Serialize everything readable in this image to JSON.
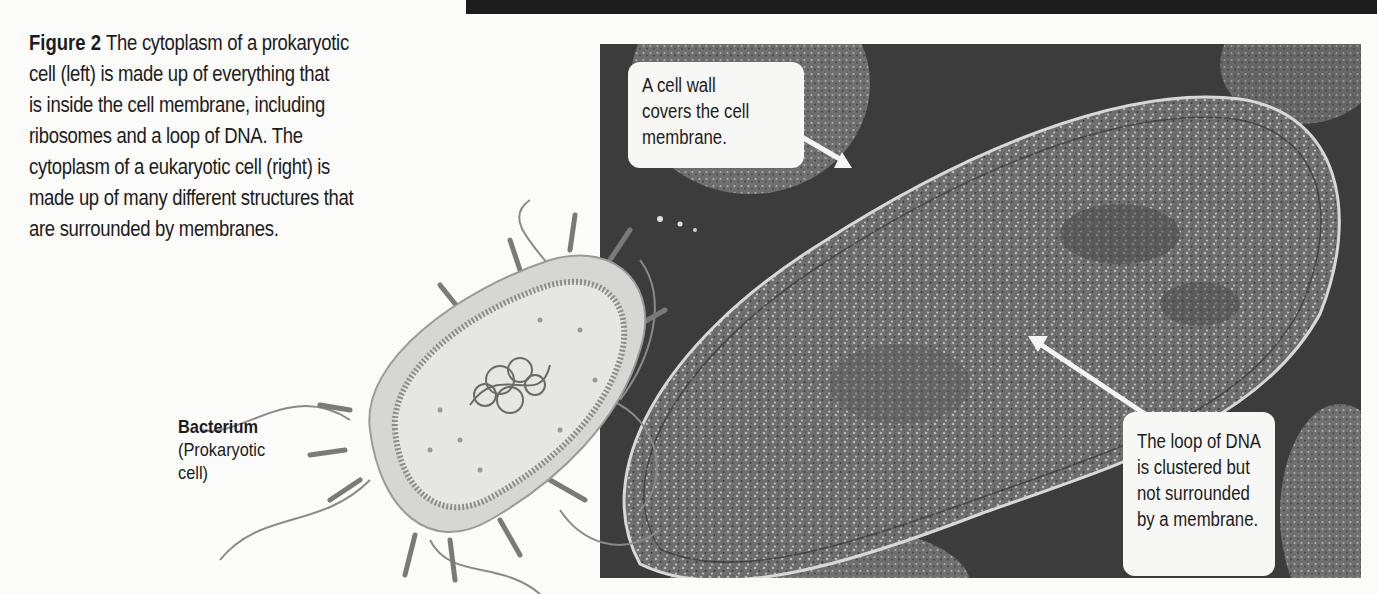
{
  "header_bar": {
    "color": "#1d1d1d"
  },
  "caption": {
    "figure_label": "Figure 2",
    "lines": [
      "The cytoplasm of a prokaryotic",
      "cell (left) is made up of everything that",
      "is inside the cell membrane, including",
      "ribosomes and a loop of DNA. The",
      "cytoplasm of a eukaryotic cell (right) is",
      "made up of many different structures that",
      "are surrounded by membranes."
    ]
  },
  "illustration": {
    "label_title": "Bacterium",
    "label_lines": [
      "(Prokaryotic",
      "cell)"
    ]
  },
  "micrograph": {
    "callouts": [
      {
        "id": "cell-wall",
        "lines": [
          "A cell wall",
          "covers the cell",
          "membrane."
        ]
      },
      {
        "id": "dna-loop",
        "lines": [
          "The loop of DNA",
          "is clustered but",
          "not surrounded",
          "by a membrane."
        ]
      }
    ]
  }
}
